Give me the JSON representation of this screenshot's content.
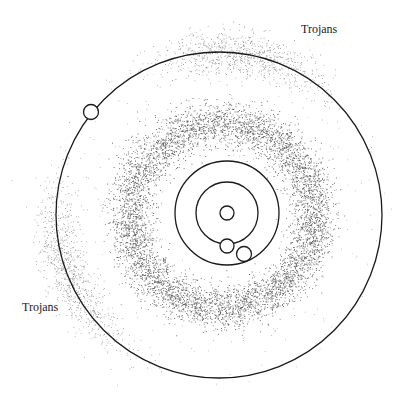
{
  "labels": {
    "trojans_top": "Trojans",
    "trojans_left": "Trojans"
  },
  "colors": {
    "background": "#ffffff",
    "stroke": "#1a1a1a",
    "asteroid": "#333333"
  },
  "geometry": {
    "sun": {
      "cx": 227,
      "cy": 213,
      "r": 7
    },
    "earth_orbit": {
      "cx": 227,
      "cy": 213,
      "r": 31
    },
    "earth": {
      "cx": 227,
      "cy": 246,
      "r": 7
    },
    "mars_orbit": {
      "cx": 227,
      "cy": 213,
      "r": 52
    },
    "mars": {
      "cx": 244,
      "cy": 254,
      "r": 7.5
    },
    "jupiter_orbit": {
      "cx": 219,
      "cy": 215,
      "r": 163
    },
    "jupiter": {
      "cx": 91,
      "cy": 112,
      "r": 7.5
    },
    "belt": {
      "cx": 222,
      "cy": 215,
      "r_inner": 75,
      "r_outer": 110
    }
  }
}
